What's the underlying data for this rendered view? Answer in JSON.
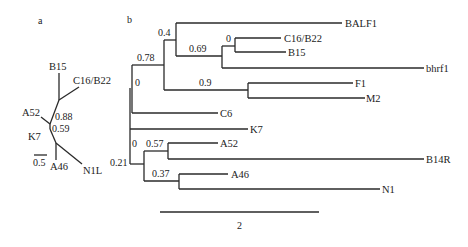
{
  "panels": {
    "a": {
      "label": "a",
      "type": "unrooted-tree",
      "tips": {
        "B15": "B15",
        "C16B22": "C16/B22",
        "A52": "A52",
        "K7": "K7",
        "A46": "A46",
        "N1L": "N1L"
      },
      "support": {
        "upper": "0.88",
        "lower": "0.59"
      },
      "scale_bar": {
        "value": "0.5"
      }
    },
    "b": {
      "label": "b",
      "type": "rectangular-tree",
      "tips": {
        "BALF1": "BALF1",
        "C16B22": "C16/B22",
        "B15": "B15",
        "bhrf1": "bhrf1",
        "F1": "F1",
        "M2": "M2",
        "C6": "C6",
        "K7": "K7",
        "A52": "A52",
        "B14R": "B14R",
        "A46": "A46",
        "N1": "N1"
      },
      "support": {
        "n_0_4": "0.4",
        "n_0_69": "0.69",
        "n_0_c16": "0",
        "n_0_78": "0.78",
        "n_0_9": "0.9",
        "n_0_inner": "0",
        "n_0_lower": "0",
        "n_0_57": "0.57",
        "n_0_37": "0.37",
        "root": "0.21"
      },
      "scale_bar": {
        "value": "2"
      }
    }
  }
}
